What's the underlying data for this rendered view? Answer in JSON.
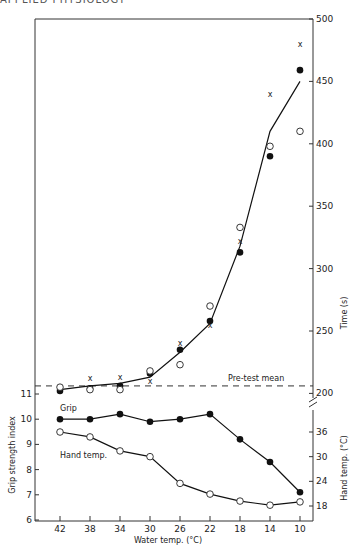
{
  "header": {
    "running_head": "APPLIED PHYSIOLOGY"
  },
  "chart_data": [
    {
      "type": "line",
      "panel": "upper",
      "title": "",
      "xlabel": "Water temp. (°C)",
      "ylabel": "Time (s)",
      "x": [
        42,
        38,
        34,
        30,
        26,
        22,
        18,
        14,
        10
      ],
      "xlim": [
        42,
        10
      ],
      "ylim": [
        190,
        500
      ],
      "yticks": [
        200,
        250,
        300,
        350,
        400,
        450,
        500
      ],
      "grid": false,
      "series": [
        {
          "name": "Mean (line)",
          "marker": "none",
          "values": [
            203,
            206,
            208,
            213,
            233,
            256,
            318,
            410,
            450
          ]
        },
        {
          "name": "Filled circles",
          "marker": "filled-circle",
          "values": [
            202,
            204,
            206,
            216,
            235,
            258,
            313,
            390,
            459
          ]
        },
        {
          "name": "Open circles",
          "marker": "open-circle",
          "values": [
            205,
            203,
            203,
            218,
            223,
            270,
            333,
            398,
            410
          ]
        },
        {
          "name": "Crosses",
          "marker": "x",
          "values": [
            null,
            212,
            213,
            210,
            240,
            255,
            322,
            440,
            480
          ]
        }
      ],
      "annotations": [
        {
          "text": "Pre-test mean",
          "y": 206,
          "style": "dashed"
        }
      ]
    },
    {
      "type": "line",
      "panel": "lower",
      "xlabel": "Water temp. (°C)",
      "x": [
        42,
        38,
        34,
        30,
        26,
        22,
        18,
        14,
        10
      ],
      "y_left": {
        "label": "Grip strength index",
        "ylim": [
          6,
          11
        ],
        "ticks": [
          6,
          7,
          8,
          9,
          10,
          11
        ]
      },
      "y_right": {
        "label": "Hand temp. (°C)",
        "ylim": [
          15,
          36
        ],
        "ticks": [
          18,
          24,
          30,
          36
        ]
      },
      "series": [
        {
          "name": "Grip",
          "axis": "left",
          "marker": "filled-circle",
          "values": [
            10.0,
            10.0,
            10.2,
            9.9,
            10.0,
            10.2,
            9.2,
            8.3,
            7.1
          ]
        },
        {
          "name": "Hand temp.",
          "axis": "right",
          "marker": "open-circle",
          "values": [
            36.0,
            34.8,
            31.4,
            30.0,
            23.5,
            20.9,
            19.2,
            18.2,
            19.0
          ]
        }
      ]
    }
  ],
  "labels": {
    "time_axis": "Time (s)",
    "grip_axis": "Grip strength index",
    "hand_axis": "Hand temp. (°C)",
    "x_axis": "Water temp. (°C)",
    "pretest": "Pre-test mean",
    "grip_series": "Grip",
    "hand_series": "Hand temp.",
    "time_ticks": [
      "500",
      "450",
      "400",
      "350",
      "300",
      "250",
      "200"
    ],
    "grip_ticks": [
      "11",
      "10",
      "9",
      "8",
      "7",
      "6"
    ],
    "hand_ticks": [
      "36",
      "30",
      "24",
      "18"
    ],
    "x_ticks": [
      "42",
      "38",
      "34",
      "30",
      "26",
      "22",
      "18",
      "14",
      "10"
    ]
  }
}
